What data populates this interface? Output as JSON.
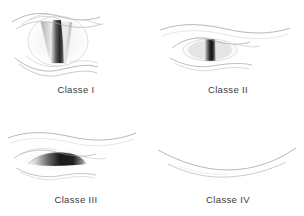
{
  "figure": {
    "background_color": "#ffffff",
    "line_color": "#8a8a8a",
    "label_color": "#3a3a3a",
    "shadow_color": "#1a1a1a",
    "columns": 2,
    "rows": 2
  },
  "panels": [
    {
      "id": "classe-1",
      "label": "Classe I",
      "structure": "soft palate, fauces, uvula, pillars visible",
      "opening": "wide",
      "uvula_visible": true
    },
    {
      "id": "classe-2",
      "label": "Classe II",
      "structure": "soft palate, fauces, uvula visible",
      "opening": "narrow",
      "uvula_visible": true
    },
    {
      "id": "classe-3",
      "label": "Classe III",
      "structure": "soft palate, base of uvula visible",
      "opening": "slit",
      "uvula_visible": false
    },
    {
      "id": "classe-4",
      "label": "Classe IV",
      "structure": "soft palate not visible",
      "opening": "closed",
      "uvula_visible": false
    }
  ]
}
